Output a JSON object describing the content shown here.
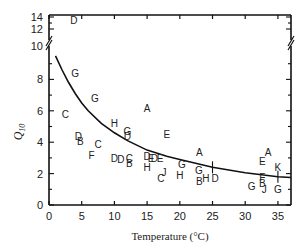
{
  "chart_data": {
    "type": "scatter",
    "title": "",
    "xlabel": "Temperature (°C)",
    "ylabel": "Q10",
    "ylabel_main": "Q",
    "ylabel_sub": "10",
    "xlim": [
      0,
      37
    ],
    "ylim": [
      0,
      14
    ],
    "y_axis_break": {
      "between": [
        10,
        12
      ],
      "note": "broken axis; upper segment shows 12–14"
    },
    "grid": false,
    "legend": "none (points labelled by letter code A–K)",
    "x_ticks": [
      0,
      5,
      10,
      15,
      20,
      25,
      30,
      35
    ],
    "x_tick_labels": [
      "0",
      "5",
      "10",
      "15",
      "20",
      "25",
      "30",
      "35"
    ],
    "y_ticks_lower": [
      0,
      2,
      4,
      6,
      8,
      10
    ],
    "y_tick_labels_lower": [
      "0",
      "2",
      "4",
      "6",
      "8",
      "10"
    ],
    "y_ticks_upper": [
      12,
      14
    ],
    "y_tick_labels_upper": [
      "12",
      "14"
    ],
    "points": [
      {
        "label": "D",
        "x": 3.8,
        "y": 13.5
      },
      {
        "label": "G",
        "x": 4.0,
        "y": 8.4
      },
      {
        "label": "G",
        "x": 7.0,
        "y": 6.8
      },
      {
        "label": "C",
        "x": 2.5,
        "y": 5.8
      },
      {
        "label": "A",
        "x": 15.0,
        "y": 6.2
      },
      {
        "label": "H",
        "x": 10.0,
        "y": 5.2
      },
      {
        "label": "G",
        "x": 12.0,
        "y": 4.7
      },
      {
        "label": "D",
        "x": 12.0,
        "y": 4.4
      },
      {
        "label": "E",
        "x": 18.0,
        "y": 4.5
      },
      {
        "label": "D",
        "x": 4.5,
        "y": 4.4
      },
      {
        "label": "B",
        "x": 4.8,
        "y": 4.1
      },
      {
        "label": "C",
        "x": 7.5,
        "y": 3.9
      },
      {
        "label": "F",
        "x": 6.5,
        "y": 3.2
      },
      {
        "label": "D",
        "x": 10.0,
        "y": 3.0
      },
      {
        "label": "D",
        "x": 11.0,
        "y": 2.9
      },
      {
        "label": "C",
        "x": 12.3,
        "y": 3.0
      },
      {
        "label": "B",
        "x": 12.3,
        "y": 2.7
      },
      {
        "label": "D",
        "x": 15.0,
        "y": 3.1
      },
      {
        "label": "E",
        "x": 15.6,
        "y": 3.0
      },
      {
        "label": "D",
        "x": 16.1,
        "y": 3.0
      },
      {
        "label": "E",
        "x": 17.0,
        "y": 3.0
      },
      {
        "label": "H",
        "x": 15.0,
        "y": 2.4
      },
      {
        "label": "G",
        "x": 20.3,
        "y": 2.6
      },
      {
        "label": "J",
        "x": 17.6,
        "y": 2.1
      },
      {
        "label": "C",
        "x": 17.1,
        "y": 1.7
      },
      {
        "label": "H",
        "x": 20.0,
        "y": 1.9
      },
      {
        "label": "A",
        "x": 23.0,
        "y": 3.4
      },
      {
        "label": "G",
        "x": 22.9,
        "y": 2.2
      },
      {
        "label": "B",
        "x": 23.0,
        "y": 1.5
      },
      {
        "label": "H",
        "x": 24.0,
        "y": 1.7
      },
      {
        "label": "D",
        "x": 25.4,
        "y": 1.7
      },
      {
        "label": "G",
        "x": 31.0,
        "y": 1.2
      },
      {
        "label": "F",
        "x": 32.6,
        "y": 1.8
      },
      {
        "label": "B",
        "x": 32.6,
        "y": 1.4
      },
      {
        "label": "J",
        "x": 32.9,
        "y": 1.0
      },
      {
        "label": "E",
        "x": 32.6,
        "y": 2.8
      },
      {
        "label": "A",
        "x": 33.5,
        "y": 3.4
      },
      {
        "label": "K",
        "x": 35.0,
        "y": 2.4
      },
      {
        "label": "G",
        "x": 35.0,
        "y": 1.0
      }
    ],
    "fit_curve": {
      "description": "decreasing fitted curve (Q10 vs temperature)",
      "x": [
        1,
        2,
        3,
        4,
        5,
        6,
        8,
        10,
        12,
        15,
        18,
        20,
        25,
        30,
        35,
        37
      ],
      "y": [
        9.5,
        8.6,
        7.8,
        7.1,
        6.5,
        6.0,
        5.2,
        4.6,
        4.1,
        3.5,
        3.1,
        2.9,
        2.4,
        2.05,
        1.8,
        1.75
      ]
    },
    "error_bar_markers": [
      {
        "x": 25.0,
        "y": 2.4
      },
      {
        "x": 35.0,
        "y": 1.8
      }
    ]
  }
}
